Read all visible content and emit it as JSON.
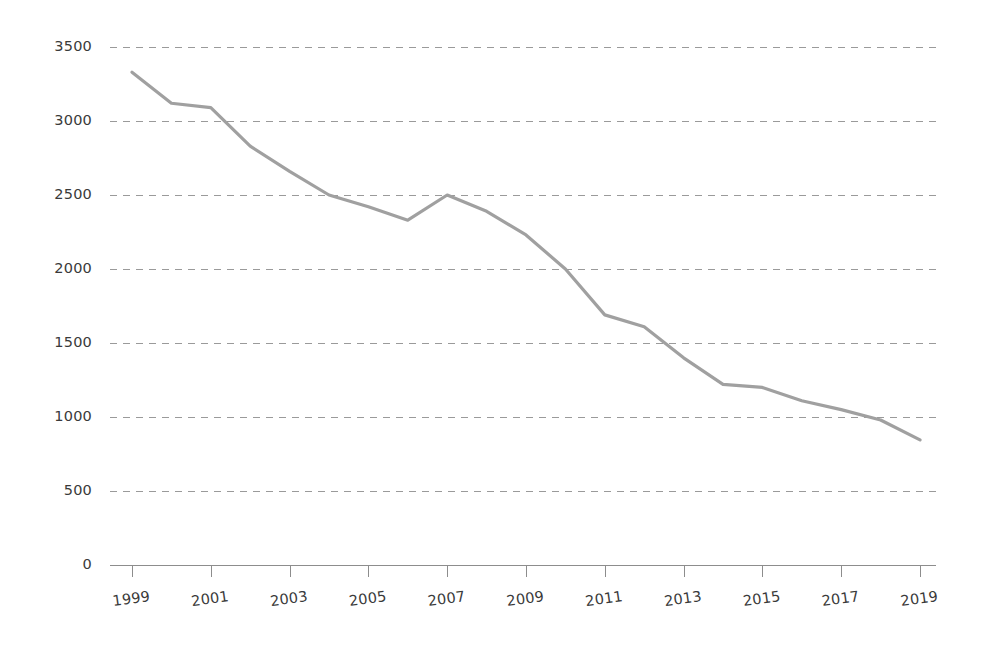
{
  "chart_data": {
    "type": "line",
    "title": "",
    "subtitle": "",
    "xlabel": "",
    "ylabel": "",
    "grid": "horizontal-dashed",
    "legend": "none",
    "xlim": [
      1999,
      2019
    ],
    "ylim": [
      0,
      3500
    ],
    "x": [
      1999,
      2000,
      2001,
      2002,
      2003,
      2004,
      2005,
      2006,
      2007,
      2008,
      2009,
      2010,
      2011,
      2012,
      2013,
      2014,
      2015,
      2016,
      2017,
      2018,
      2019
    ],
    "series": [
      {
        "name": "series-1",
        "color": "#a0a0a0",
        "values": [
          3330,
          3120,
          3090,
          2830,
          2660,
          2500,
          2420,
          2330,
          2500,
          2390,
          2230,
          2000,
          1690,
          1610,
          1400,
          1220,
          1200,
          1110,
          1050,
          980,
          845
        ]
      }
    ],
    "y_ticks": [
      0,
      500,
      1000,
      1500,
      2000,
      2500,
      3000,
      3500
    ],
    "y_tick_labels": [
      "0",
      "500",
      "1000",
      "1500",
      "2000",
      "2500",
      "3000",
      "3500"
    ],
    "x_ticks": [
      1999,
      2001,
      2003,
      2005,
      2007,
      2009,
      2011,
      2013,
      2015,
      2017,
      2019
    ],
    "x_tick_labels": [
      "1999",
      "2001",
      "2003",
      "2005",
      "2007",
      "2009",
      "2011",
      "2013",
      "2015",
      "2017",
      "2019"
    ]
  },
  "axes": {
    "y_axis_name": "value-axis",
    "x_axis_name": "year-axis"
  },
  "colors": {
    "line": "#a0a0a0",
    "grid": "#9a9a9a",
    "axis": "#8d8d8d",
    "text": "#3a3a3a",
    "background": "#ffffff"
  }
}
